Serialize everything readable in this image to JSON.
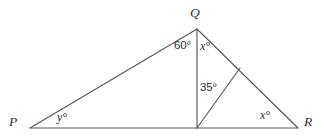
{
  "figure": {
    "kind": "geometry-diagram",
    "background_color": "#ffffff",
    "line_color": "#58585c",
    "text_color": "#2f2f33",
    "vertices": [
      {
        "id": "P",
        "label": "P",
        "x": 30,
        "y": 128
      },
      {
        "id": "Q",
        "label": "Q",
        "x": 197,
        "y": 29
      },
      {
        "id": "R",
        "label": "R",
        "x": 298,
        "y": 128
      },
      {
        "id": "S",
        "label": "",
        "x": 197,
        "y": 128
      },
      {
        "id": "T",
        "label": "",
        "x": 240,
        "y": 68
      }
    ],
    "segments": [
      {
        "name": "side-PQ",
        "from": "P",
        "to": "Q"
      },
      {
        "name": "side-QR",
        "from": "Q",
        "to": "R"
      },
      {
        "name": "base-PR",
        "from": "P",
        "to": "R"
      },
      {
        "name": "cevian-QS",
        "from": "Q",
        "to": "S"
      },
      {
        "name": "cevian-ST",
        "from": "S",
        "to": "T"
      }
    ],
    "vertex_labels": {
      "Q": "Q",
      "P": "P",
      "R": "R"
    },
    "angle_labels": {
      "angle_PQS": "60°",
      "angle_SQR": "x°",
      "angle_SQ_to_ST": "35°",
      "angle_P": "y°",
      "angle_R": "x°"
    }
  }
}
